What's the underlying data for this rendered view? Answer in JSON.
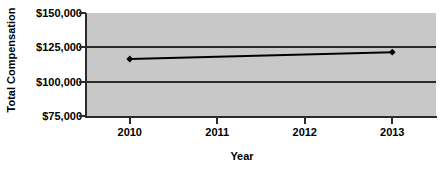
{
  "chart_data": {
    "type": "line",
    "title": "",
    "xlabel": "Year",
    "ylabel": "Total Compensation",
    "x": [
      2010,
      2011,
      2012,
      2013
    ],
    "x_tick_labels": [
      "2010",
      "2011",
      "2012",
      "2013"
    ],
    "y_tick_labels": [
      "$150,000",
      "$125,000",
      "$100,000",
      "$75,000"
    ],
    "y_ticks": [
      150000,
      125000,
      100000,
      75000
    ],
    "ylim": [
      75000,
      150000
    ],
    "xlim": [
      2009.5,
      2013.5
    ],
    "grid": true,
    "legend": "none",
    "series": [
      {
        "name": "Total Compensation",
        "marker": "diamond",
        "color": "#000000",
        "points": [
          {
            "x": 2010,
            "y": 116500,
            "label": ""
          },
          {
            "x": 2013,
            "y": 121500,
            "label": ""
          }
        ],
        "values": [
          116500,
          null,
          null,
          121500
        ]
      }
    ],
    "plot_background": "#c8c8c8",
    "axis_color": "#2b2b2b",
    "figure_background": "#ffffff"
  },
  "axes": {
    "y_title": "Total Compensation",
    "x_title": "Year"
  }
}
